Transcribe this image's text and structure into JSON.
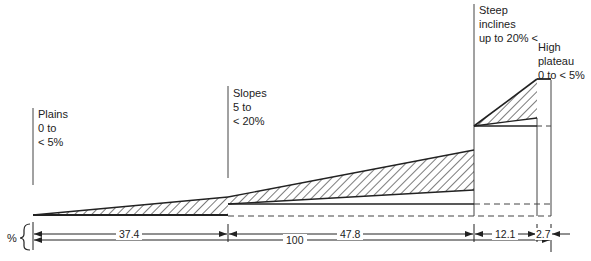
{
  "diagram": {
    "regions": [
      {
        "name": "Plains",
        "range_line1": "0 to",
        "range_line2": "< 5%",
        "width_pct": "37.4"
      },
      {
        "name": "Slopes",
        "range_line1": "5 to",
        "range_line2": "< 20%",
        "width_pct": "47.8"
      },
      {
        "name": "Steep",
        "range_line1": "inclines",
        "range_line2": "up to 20% <",
        "width_pct": "12.1"
      },
      {
        "name": "High",
        "range_line1": "plateau",
        "range_line2": "0 to < 5%",
        "width_pct": "2.7"
      }
    ],
    "total_label": "100",
    "axis_unit": "%"
  }
}
